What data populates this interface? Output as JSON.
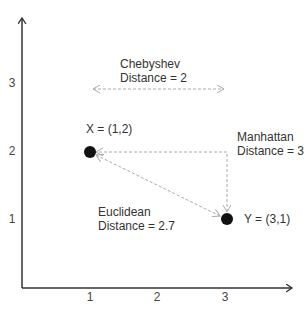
{
  "axes": {
    "x_ticks": [
      "1",
      "2",
      "3"
    ],
    "y_ticks": [
      "1",
      "2",
      "3"
    ]
  },
  "points": [
    {
      "id": "X",
      "label": "X = (1,2)",
      "x": 1,
      "y": 2
    },
    {
      "id": "Y",
      "label": "Y = (3,1)",
      "x": 3,
      "y": 1
    }
  ],
  "annotations": {
    "chebyshev": {
      "line1": "Chebyshev",
      "line2": "Distance = 2"
    },
    "manhattan": {
      "line1": "Manhattan",
      "line2": "Distance = 3"
    },
    "euclidean": {
      "line1": "Euclidean",
      "line2": "Distance = 2.7"
    }
  },
  "colors": {
    "axis": "#333333",
    "point": "#111111",
    "dashed": "#aaaaaa",
    "text": "#333333"
  }
}
